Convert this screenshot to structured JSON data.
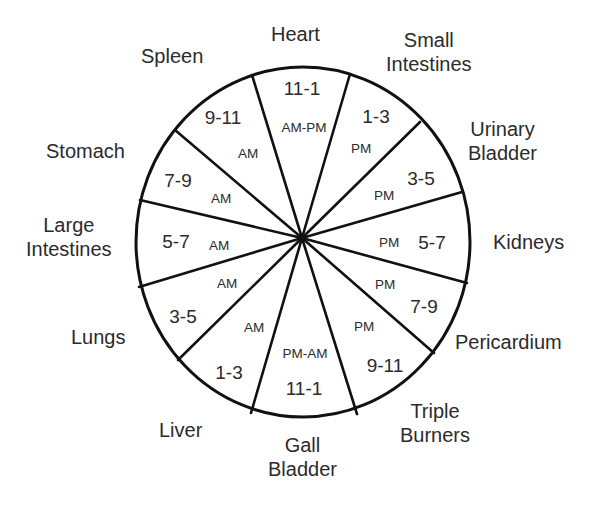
{
  "diagram": {
    "title": "",
    "type": "organ-clock",
    "stroke_color": "#111111",
    "segments": [
      {
        "organ": "Heart",
        "organ_lines": [
          "Heart"
        ],
        "hours": "11-1",
        "period": "AM-PM"
      },
      {
        "organ": "Small Intestines",
        "organ_lines": [
          "Small",
          "Intestines"
        ],
        "hours": "1-3",
        "period": "PM"
      },
      {
        "organ": "Urinary Bladder",
        "organ_lines": [
          "Urinary",
          "Bladder"
        ],
        "hours": "3-5",
        "period": "PM"
      },
      {
        "organ": "Kidneys",
        "organ_lines": [
          "Kidneys"
        ],
        "hours": "5-7",
        "period": "PM"
      },
      {
        "organ": "Pericardium",
        "organ_lines": [
          "Pericardium"
        ],
        "hours": "7-9",
        "period": "PM"
      },
      {
        "organ": "Triple Burners",
        "organ_lines": [
          "Triple",
          "Burners"
        ],
        "hours": "9-11",
        "period": "PM"
      },
      {
        "organ": "Gall Bladder",
        "organ_lines": [
          "Gall",
          "Bladder"
        ],
        "hours": "11-1",
        "period": "PM-AM"
      },
      {
        "organ": "Liver",
        "organ_lines": [
          "Liver"
        ],
        "hours": "1-3",
        "period": "AM"
      },
      {
        "organ": "Lungs",
        "organ_lines": [
          "Lungs"
        ],
        "hours": "3-5",
        "period": "AM"
      },
      {
        "organ": "Large Intestines",
        "organ_lines": [
          "Large",
          "Intestines"
        ],
        "hours": "5-7",
        "period": "AM"
      },
      {
        "organ": "Stomach",
        "organ_lines": [
          "Stomach"
        ],
        "hours": "7-9",
        "period": "AM"
      },
      {
        "organ": "Spleen",
        "organ_lines": [
          "Spleen"
        ],
        "hours": "9-11",
        "period": "AM"
      }
    ]
  }
}
